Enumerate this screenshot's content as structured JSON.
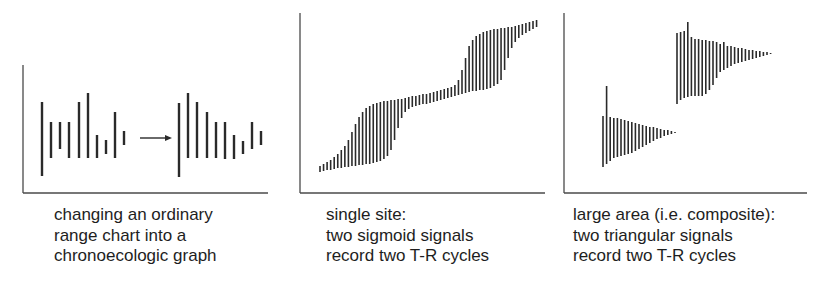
{
  "figure": {
    "stroke_color": "#2a2a2a",
    "axis_color": "#4a4a4a",
    "panels": [
      {
        "id": "ordinary-to-chronoecologic",
        "caption_lines": [
          "changing an ordinary",
          "range chart into a",
          "chronoecologic graph"
        ],
        "axes": {
          "x0": 23,
          "y_top": 65,
          "y_base": 193,
          "x_end": 268
        },
        "arrow": {
          "x1": 140,
          "x2": 172,
          "y": 138
        },
        "bar_width": 2.4,
        "ordinary_bars": [
          [
            42,
            102,
            176
          ],
          [
            51,
            122,
            158
          ],
          [
            60,
            122,
            149
          ],
          [
            69,
            122,
            158
          ],
          [
            79,
            102,
            158
          ],
          [
            88,
            93,
            158
          ],
          [
            97,
            135,
            158
          ],
          [
            106,
            140,
            154
          ],
          [
            115,
            112,
            158
          ],
          [
            124,
            131,
            145
          ]
        ],
        "chronoecologic_bars": [
          [
            179,
            103,
            177
          ],
          [
            188,
            93,
            158
          ],
          [
            197,
            102,
            158
          ],
          [
            207,
            112,
            158
          ],
          [
            216,
            122,
            158
          ],
          [
            225,
            122,
            159
          ],
          [
            234,
            135,
            159
          ],
          [
            243,
            141,
            154
          ],
          [
            252,
            122,
            149
          ],
          [
            261,
            131,
            145
          ]
        ]
      },
      {
        "id": "single-site",
        "caption_lines": [
          "single site:",
          "two sigmoid signals",
          "record two T-R cycles"
        ],
        "axes": {
          "x0": 300,
          "y_top": 13,
          "y_base": 193,
          "x_end": 545
        },
        "bar_width": 1.6,
        "bars": {
          "x_start": 320,
          "x_step": 3.55,
          "tops": [
            166,
            164,
            162,
            160,
            157,
            154,
            150,
            146,
            140,
            132,
            124,
            117,
            112,
            108,
            106,
            104,
            103,
            102,
            101,
            101,
            100,
            100,
            99,
            99,
            98,
            97,
            96,
            96,
            95,
            94,
            94,
            93,
            92,
            91,
            90,
            89,
            88,
            87,
            85,
            80,
            70,
            58,
            46,
            40,
            36,
            34,
            32,
            31,
            30,
            29,
            29,
            28,
            28,
            27,
            27,
            26,
            25,
            24,
            23,
            22,
            21,
            20
          ],
          "bottoms": [
            172,
            171,
            170,
            170,
            169,
            168,
            168,
            167,
            167,
            166,
            166,
            165,
            165,
            164,
            164,
            163,
            162,
            161,
            159,
            156,
            150,
            140,
            128,
            118,
            112,
            109,
            107,
            106,
            105,
            104,
            104,
            103,
            102,
            101,
            100,
            99,
            98,
            97,
            96,
            95,
            94,
            93,
            92,
            91,
            91,
            90,
            90,
            89,
            88,
            86,
            84,
            80,
            70,
            58,
            48,
            42,
            38,
            35,
            33,
            31,
            29,
            27
          ]
        }
      },
      {
        "id": "large-area-composite",
        "caption_lines": [
          "large area (i.e. composite):",
          "two triangular signals",
          "record two T-R cycles"
        ],
        "axes": {
          "x0": 564,
          "y_top": 13,
          "y_base": 193,
          "x_end": 807
        },
        "bar_width": 1.6,
        "signals": [
          {
            "name": "lower-triangle",
            "x_start": 603,
            "x_step": 3.6,
            "tops": [
              116,
              86,
              117,
              118,
              118,
              119,
              120,
              121,
              122,
              123,
              124,
              125,
              126,
              127,
              127,
              128,
              129,
              130,
              130,
              131,
              132
            ],
            "bottoms": [
              167,
              164,
              161,
              158,
              157,
              156,
              155,
              154,
              153,
              151,
              149,
              147,
              145,
              143,
              141,
              139,
              138,
              136,
              135,
              134,
              133
            ]
          },
          {
            "name": "upper-triangle",
            "x_start": 677,
            "x_step": 3.6,
            "tops": [
              33,
              32,
              31,
              22,
              37,
              39,
              39,
              40,
              40,
              41,
              41,
              42,
              44,
              42,
              46,
              46,
              47,
              48,
              48,
              49,
              50,
              50,
              51,
              51,
              52,
              52,
              53
            ],
            "bottoms": [
              104,
              100,
              98,
              97,
              96,
              96,
              96,
              96,
              94,
              90,
              85,
              78,
              72,
              70,
              68,
              66,
              64,
              63,
              62,
              61,
              60,
              59,
              58,
              57,
              56,
              55,
              54
            ]
          }
        ]
      }
    ]
  },
  "captions": {
    "panel1": {
      "line1": "changing an ordinary",
      "line2": "range chart into a",
      "line3": "chronoecologic graph"
    },
    "panel2": {
      "line1": "single site:",
      "line2": "two sigmoid signals",
      "line3": "record two T-R cycles"
    },
    "panel3": {
      "line1": "large area (i.e. composite):",
      "line2": "two triangular signals",
      "line3": "record two T-R cycles"
    }
  }
}
